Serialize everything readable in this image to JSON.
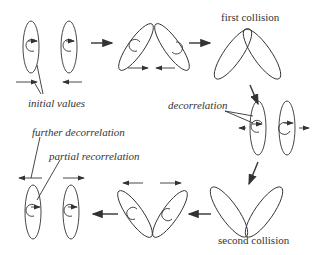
{
  "labels": {
    "first_collision": "first collision",
    "second_collision": "second collision",
    "initial_values": "initial values",
    "decorrelation": "decorrelation",
    "further_decorrelation": "further decorrelation",
    "partial_recorrelation": "partial recorrelation"
  },
  "colors": {
    "stroke": "#333333",
    "background": "#ffffff"
  },
  "stages": [
    {
      "name": "initial",
      "ellipses": 2,
      "tilt": "vertical"
    },
    {
      "name": "approach",
      "ellipses": 2,
      "tilt": "inward"
    },
    {
      "name": "first-collision",
      "ellipses": 2,
      "tilt": "V-top"
    },
    {
      "name": "decorrelation",
      "ellipses": 2,
      "tilt": "vertical"
    },
    {
      "name": "second-collision",
      "ellipses": 2,
      "tilt": "V-bottom"
    },
    {
      "name": "after-second",
      "ellipses": 2,
      "tilt": "inward"
    },
    {
      "name": "final",
      "ellipses": 2,
      "tilt": "vertical"
    }
  ]
}
